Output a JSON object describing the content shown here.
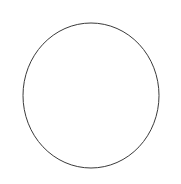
{
  "figure": {
    "name": "circle-outline-figure",
    "background_color": "#ffffff",
    "width": 181,
    "height": 184,
    "has_text": false,
    "has_fill": false
  },
  "chart_data": {
    "type": "scatter",
    "title": "",
    "subtitle": "",
    "xlabel": "",
    "ylabel": "",
    "grid": false,
    "legend": null,
    "axes_visible": false,
    "tick_labels_x": [],
    "tick_labels_y": [],
    "annotations": [],
    "shapes": [
      {
        "shape": "circle",
        "label": "circle-outline",
        "center_x": 91,
        "center_y": 95.5,
        "radius_x": 68,
        "radius_y": 72.5,
        "stroke_color": "#3a3a3a",
        "stroke_width": 1,
        "fill": "none",
        "bounds": {
          "left": 23,
          "top": 23,
          "right": 159,
          "bottom": 168
        }
      }
    ]
  }
}
